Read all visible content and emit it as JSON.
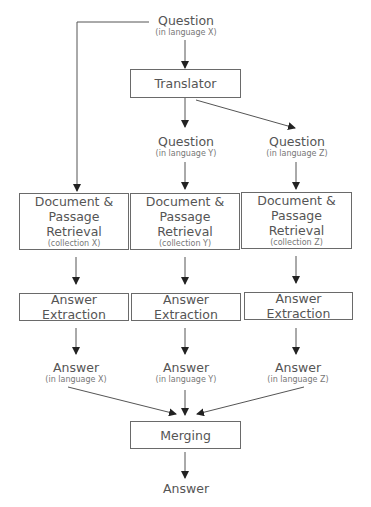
{
  "caption_fragment": "",
  "nodes": {
    "question_x": {
      "title": "Question",
      "sub": "(in language X)"
    },
    "translator": {
      "title": "Translator"
    },
    "question_y": {
      "title": "Question",
      "sub": "(in language Y)"
    },
    "question_z": {
      "title": "Question",
      "sub": "(in language Z)"
    },
    "retrieval_x": {
      "title1": "Document &",
      "title2": "Passage Retrieval",
      "sub": "(collection X)"
    },
    "retrieval_y": {
      "title1": "Document &",
      "title2": "Passage Retrieval",
      "sub": "(collection Y)"
    },
    "retrieval_z": {
      "title1": "Document &",
      "title2": "Passage Retrieval",
      "sub": "(collection Z)"
    },
    "extraction_x": {
      "title": "Answer Extraction"
    },
    "extraction_y": {
      "title": "Answer Extraction"
    },
    "extraction_z": {
      "title": "Answer Extraction"
    },
    "answer_x": {
      "title": "Answer",
      "sub": "(in language X)"
    },
    "answer_y": {
      "title": "Answer",
      "sub": "(in language Y)"
    },
    "answer_z": {
      "title": "Answer",
      "sub": "(in language Z)"
    },
    "merging": {
      "title": "Merging"
    },
    "answer_final": {
      "title": "Answer"
    }
  },
  "colors": {
    "line": "#555555",
    "border": "#6a6a6a",
    "text": "#555555"
  }
}
